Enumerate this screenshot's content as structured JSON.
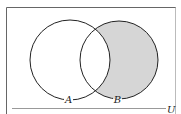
{
  "diagram": {
    "type": "venn",
    "universe_label": "U",
    "sets": [
      {
        "name": "A",
        "label": "A",
        "cx": 70,
        "cy": 60,
        "r": 40
      },
      {
        "name": "B",
        "label": "B",
        "cx": 119,
        "cy": 60,
        "r": 39
      }
    ],
    "shaded_region": "B - A",
    "colors": {
      "shade": "#d6d6d6",
      "stroke": "#222222",
      "frame": "#555555",
      "background": "#ffffff"
    }
  }
}
